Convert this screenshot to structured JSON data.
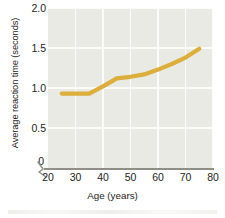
{
  "chart_data": {
    "type": "line",
    "title": "",
    "xlabel": "Age (years)",
    "ylabel": "Average reaction time (seconds)",
    "xlim": [
      20,
      80
    ],
    "ylim": [
      0,
      2.0
    ],
    "y_axis_break": true,
    "zero_label": "0",
    "grid": true,
    "legend": "none",
    "line_color": "#dcae3c",
    "plot_background": "#e9eae4",
    "gridline_color": "#fbfbf9",
    "axis_color": "#8f8f88",
    "xticks": [
      20,
      30,
      40,
      50,
      60,
      70,
      80
    ],
    "xtick_labels": [
      "20",
      "30",
      "40",
      "50",
      "60",
      "70",
      "80"
    ],
    "yticks": [
      0.5,
      1.0,
      1.5,
      2.0
    ],
    "ytick_labels": [
      "0.5",
      "1.0",
      "1.5",
      "2.0"
    ],
    "series": [
      {
        "name": "Average reaction time",
        "x": [
          25,
          30,
          35,
          40,
          45,
          50,
          55,
          60,
          65,
          70,
          75
        ],
        "values": [
          0.93,
          0.93,
          0.93,
          1.02,
          1.12,
          1.14,
          1.17,
          1.23,
          1.3,
          1.38,
          1.49
        ]
      }
    ]
  }
}
